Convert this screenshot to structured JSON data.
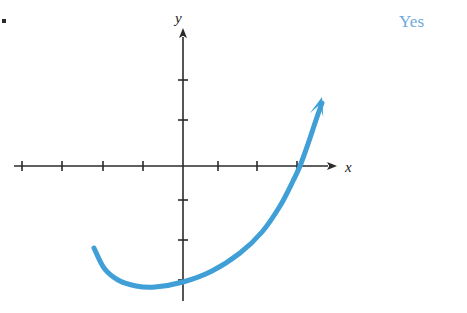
{
  "figure": {
    "bullet_marker": "list-bullet",
    "answer_label": "Yes",
    "answer_color": "#6fa8dc",
    "curve_color": "#3f9fd6",
    "axis_color": "#2b2b2b",
    "background_color": "#ffffff",
    "x_axis": {
      "label": "x",
      "line_y": 166,
      "start_x": 14,
      "arrow_tip_x": 337,
      "tick_positions": [
        22,
        62,
        103,
        143,
        218,
        257,
        297
      ],
      "tick_half_height": 5
    },
    "y_axis": {
      "label": "y",
      "line_x": 183,
      "start_y": 301,
      "arrow_tip_y": 28,
      "tick_positions": [
        80,
        120,
        200,
        240,
        280
      ],
      "tick_half_width": 5
    },
    "origin": {
      "x": 183,
      "y": 166
    }
  },
  "chart_data": {
    "type": "line",
    "title": "",
    "xlabel": "x",
    "ylabel": "y",
    "grid": false,
    "legend": null,
    "annotations": [
      {
        "text": "Yes",
        "position": "top-right",
        "color": "#6fa8dc"
      }
    ],
    "axis_pixel_ranges": {
      "x": [
        14,
        337
      ],
      "y": [
        28,
        301
      ]
    },
    "origin_pixel": [
      183,
      166
    ],
    "tick_spacing_px": 40,
    "series": [
      {
        "name": "curve",
        "stroke_width": 5,
        "has_end_arrow": true,
        "points_px": [
          [
            94,
            248
          ],
          [
            104,
            268
          ],
          [
            118,
            280
          ],
          [
            136,
            286
          ],
          [
            155,
            287
          ],
          [
            183,
            282
          ],
          [
            212,
            271
          ],
          [
            240,
            253
          ],
          [
            262,
            232
          ],
          [
            280,
            206
          ],
          [
            293,
            181
          ],
          [
            300,
            166
          ],
          [
            308,
            144
          ],
          [
            316,
            120
          ],
          [
            322,
            103
          ]
        ],
        "arrow_tip_px": [
          322,
          97
        ]
      }
    ]
  }
}
